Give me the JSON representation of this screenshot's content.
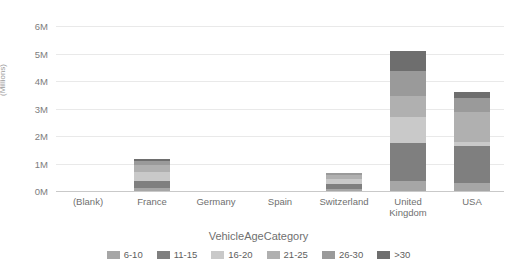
{
  "chart_data": {
    "type": "bar",
    "stacked": true,
    "title": "",
    "xlabel": "VehicleAgeCategory",
    "ylabel": "(Millions)",
    "categories": [
      "(Blank)",
      "France",
      "Germany",
      "Spain",
      "Switzerland",
      "United Kingdom",
      "USA"
    ],
    "ytick_labels": [
      "0M",
      "1M",
      "2M",
      "3M",
      "4M",
      "5M",
      "6M"
    ],
    "ytick_values": [
      0,
      1,
      2,
      3,
      4,
      5,
      6
    ],
    "ylim": [
      0,
      6
    ],
    "grid": true,
    "legend_position": "bottom",
    "series": [
      {
        "name": "6-10",
        "color": "#a6a6a6",
        "values": [
          0,
          0.1,
          0,
          0,
          0.06,
          0.35,
          0.3
        ]
      },
      {
        "name": "11-15",
        "color": "#7f7f7f",
        "values": [
          0,
          0.28,
          0,
          0,
          0.18,
          1.4,
          1.35
        ]
      },
      {
        "name": "16-20",
        "color": "#c9c9c9",
        "values": [
          0,
          0.32,
          0,
          0,
          0.2,
          0.95,
          0.12
        ]
      },
      {
        "name": "21-25",
        "color": "#b0b0b0",
        "values": [
          0,
          0.25,
          0,
          0,
          0.15,
          0.75,
          1.1
        ]
      },
      {
        "name": "26-30",
        "color": "#9a9a9a",
        "values": [
          0,
          0.15,
          0,
          0,
          0.06,
          0.9,
          0.5
        ]
      },
      {
        "name": ">30",
        "color": "#6e6e6e",
        "values": [
          0,
          0.05,
          0,
          0,
          0.0,
          0.75,
          0.23
        ]
      }
    ],
    "totals": [
      0,
      1.15,
      0,
      0,
      0.65,
      5.1,
      3.6
    ]
  },
  "axis": {
    "y_title": "(Millions)",
    "x_title": "VehicleAgeCategory"
  },
  "title_strip": {
    "text": ""
  }
}
